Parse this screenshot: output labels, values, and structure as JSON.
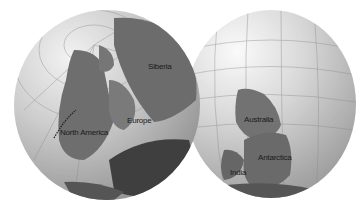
{
  "globes": {
    "left": {
      "labels": {
        "siberia": "Siberia",
        "europe": "Europe",
        "north_america": "North America"
      }
    },
    "right": {
      "labels": {
        "australia": "Australia",
        "antarctica": "Antarctica",
        "india": "India"
      }
    }
  },
  "colors": {
    "land": "#6e6e6e",
    "land_light": "#8a8a8a",
    "land_dark": "#3f3f3f",
    "background": "#ffffff"
  }
}
